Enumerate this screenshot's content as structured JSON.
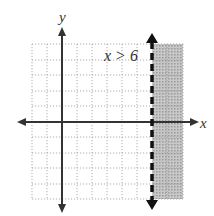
{
  "graph": {
    "inequality_label": "x > 6",
    "x_axis_label": "x",
    "y_axis_label": "y",
    "boundary": {
      "x": 6,
      "style": "dashed"
    },
    "shaded_side": "right",
    "grid": {
      "x_min": -2,
      "x_max": 8,
      "y_min": -5,
      "y_max": 5,
      "step": 1
    },
    "colors": {
      "grid": "#9a9a9a",
      "axis": "#333333",
      "boundary": "#111111",
      "shade": "#bdbdbd"
    }
  }
}
